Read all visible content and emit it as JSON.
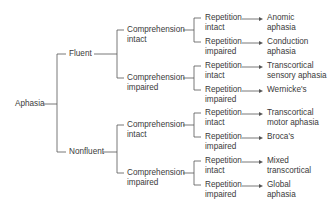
{
  "root": {
    "label": "Aphasia"
  },
  "fluency": [
    {
      "label": "Fluent",
      "comprehension": [
        {
          "line1": "Comprehension",
          "line2": "intact",
          "repetition": [
            {
              "line1": "Repetition",
              "line2": "intact",
              "result1": "Anomic",
              "result2": "aphasia"
            },
            {
              "line1": "Repetition",
              "line2": "impaired",
              "result1": "Conduction",
              "result2": "aphasia"
            }
          ]
        },
        {
          "line1": "Comprehension",
          "line2": "impaired",
          "repetition": [
            {
              "line1": "Repetition",
              "line2": "intact",
              "result1": "Transcortical",
              "result2": "sensory aphasia"
            },
            {
              "line1": "Repetition",
              "line2": "impaired",
              "result1": "Wernicke's",
              "result2": ""
            }
          ]
        }
      ]
    },
    {
      "label": "Nonfluent",
      "comprehension": [
        {
          "line1": "Comprehension",
          "line2": "intact",
          "repetition": [
            {
              "line1": "Repetition",
              "line2": "intact",
              "result1": "Transcortical",
              "result2": "motor aphasia"
            },
            {
              "line1": "Repetition",
              "line2": "impaired",
              "result1": "Broca's",
              "result2": ""
            }
          ]
        },
        {
          "line1": "Comprehension",
          "line2": "impaired",
          "repetition": [
            {
              "line1": "Repetition",
              "line2": "intact",
              "result1": "Mixed",
              "result2": "transcortical"
            },
            {
              "line1": "Repetition",
              "line2": "impaired",
              "result1": "Global",
              "result2": "aphasia"
            }
          ]
        }
      ]
    }
  ],
  "colors": {
    "line": "#555555",
    "text": "#3a3a3a"
  }
}
